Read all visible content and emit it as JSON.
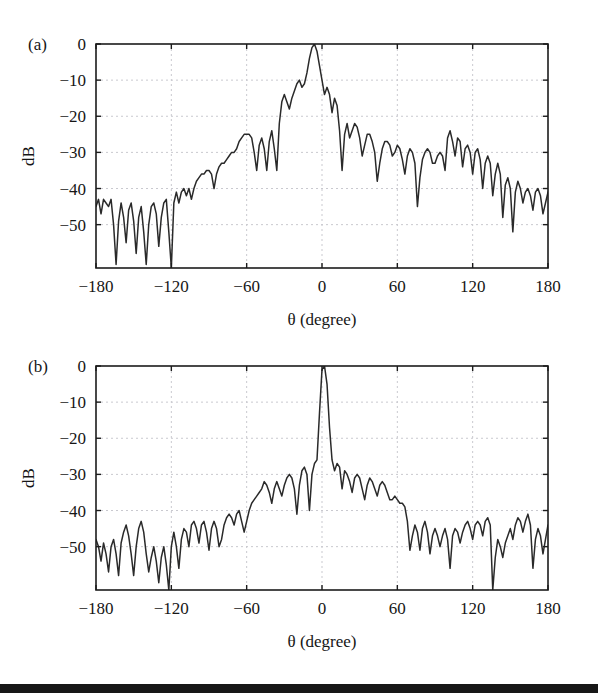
{
  "figure": {
    "background_color": "#ffffff",
    "curve_color": "#2a2a2a",
    "grid_color": "#c9c9cf",
    "axis_color": "#1c1c1c",
    "footer_bar_color": "#171717"
  },
  "panels": [
    {
      "id": "a",
      "label": "(a)",
      "xlabel": "θ (degree)",
      "ylabel": "dB",
      "xticks": [
        -180,
        -120,
        -60,
        0,
        60,
        120,
        180
      ],
      "xtick_labels": [
        "−180",
        "−120",
        "−60",
        "0",
        "60",
        "120",
        "180"
      ],
      "yticks": [
        0,
        -10,
        -20,
        -30,
        -40,
        -50
      ],
      "ytick_labels": [
        "0",
        "−10",
        "−20",
        "−30",
        "−40",
        "−50"
      ],
      "xlim": [
        -180,
        180
      ],
      "ylim": [
        -62,
        0
      ]
    },
    {
      "id": "b",
      "label": "(b)",
      "xlabel": "θ (degree)",
      "ylabel": "dB",
      "xticks": [
        -180,
        -120,
        -60,
        0,
        60,
        120,
        180
      ],
      "xtick_labels": [
        "−180",
        "−120",
        "−60",
        "0",
        "60",
        "120",
        "180"
      ],
      "yticks": [
        0,
        -10,
        -20,
        -30,
        -40,
        -50
      ],
      "ytick_labels": [
        "0",
        "−10",
        "−20",
        "−30",
        "−40",
        "−50"
      ],
      "xlim": [
        -180,
        180
      ],
      "ylim": [
        -62,
        0
      ]
    }
  ],
  "chart_data": [
    {
      "type": "line",
      "title": "(a)",
      "xlabel": "θ (degree)",
      "ylabel": "dB",
      "xlim": [
        -180,
        180
      ],
      "ylim": [
        -62,
        0
      ],
      "grid": true,
      "legend": "none",
      "series": [
        {
          "name": "beam-pattern-a",
          "x": [
            -180,
            -178,
            -176,
            -174,
            -172,
            -170,
            -168,
            -166,
            -164,
            -162,
            -160,
            -158,
            -156,
            -154,
            -152,
            -150,
            -148,
            -146,
            -144,
            -142,
            -140,
            -138,
            -136,
            -134,
            -132,
            -130,
            -128,
            -126,
            -124,
            -122,
            -120,
            -118,
            -116,
            -114,
            -112,
            -110,
            -108,
            -106,
            -104,
            -102,
            -100,
            -98,
            -96,
            -94,
            -92,
            -90,
            -88,
            -86,
            -84,
            -82,
            -80,
            -78,
            -76,
            -74,
            -72,
            -70,
            -68,
            -66,
            -64,
            -62,
            -60,
            -58,
            -56,
            -54,
            -52,
            -50,
            -48,
            -46,
            -44,
            -42,
            -40,
            -38,
            -36,
            -34,
            -32,
            -30,
            -28,
            -26,
            -24,
            -22,
            -20,
            -18,
            -16,
            -14,
            -12,
            -10,
            -8,
            -6,
            -4,
            -2,
            0,
            2,
            4,
            6,
            8,
            10,
            12,
            14,
            16,
            18,
            20,
            22,
            24,
            26,
            28,
            30,
            32,
            34,
            36,
            38,
            40,
            42,
            44,
            46,
            48,
            50,
            52,
            54,
            56,
            58,
            60,
            62,
            64,
            66,
            68,
            70,
            72,
            74,
            76,
            78,
            80,
            82,
            84,
            86,
            88,
            90,
            92,
            94,
            96,
            98,
            100,
            102,
            104,
            106,
            108,
            110,
            112,
            114,
            116,
            118,
            120,
            122,
            124,
            126,
            128,
            130,
            132,
            134,
            136,
            138,
            140,
            142,
            144,
            146,
            148,
            150,
            152,
            154,
            156,
            158,
            160,
            162,
            164,
            166,
            168,
            170,
            172,
            174,
            176,
            178,
            180
          ],
          "y": [
            -45,
            -43,
            -47,
            -43,
            -44,
            -45,
            -43,
            -50,
            -61,
            -49,
            -44,
            -48,
            -55,
            -46,
            -44,
            -49,
            -58,
            -48,
            -45,
            -52,
            -61,
            -50,
            -45,
            -44,
            -47,
            -56,
            -48,
            -44,
            -43,
            -52,
            -62,
            -44,
            -41,
            -44,
            -41,
            -40,
            -42,
            -40,
            -43,
            -40,
            -38,
            -37,
            -36,
            -36,
            -35,
            -35,
            -36,
            -40,
            -36,
            -34,
            -33,
            -33,
            -32,
            -31,
            -30,
            -30,
            -29,
            -27,
            -26,
            -25,
            -25,
            -25,
            -26,
            -30,
            -35,
            -28,
            -26,
            -29,
            -35,
            -27,
            -24,
            -29,
            -35,
            -22,
            -16,
            -14,
            -16,
            -18,
            -15,
            -13,
            -11,
            -10,
            -12,
            -11,
            -8,
            -4,
            -1,
            0,
            -2,
            -6,
            -10,
            -14,
            -12,
            -14,
            -19,
            -15,
            -17,
            -24,
            -35,
            -25,
            -22,
            -26,
            -24,
            -22,
            -23,
            -26,
            -31,
            -28,
            -25,
            -25,
            -27,
            -30,
            -38,
            -33,
            -29,
            -27,
            -27,
            -28,
            -31,
            -30,
            -28,
            -29,
            -32,
            -36,
            -31,
            -29,
            -30,
            -33,
            -45,
            -37,
            -32,
            -30,
            -29,
            -30,
            -33,
            -33,
            -31,
            -30,
            -31,
            -35,
            -26,
            -24,
            -27,
            -31,
            -26,
            -27,
            -34,
            -29,
            -28,
            -30,
            -36,
            -30,
            -29,
            -32,
            -40,
            -33,
            -31,
            -33,
            -42,
            -36,
            -33,
            -36,
            -48,
            -39,
            -37,
            -40,
            -52,
            -41,
            -38,
            -40,
            -44,
            -41,
            -40,
            -42,
            -46,
            -41,
            -40,
            -42,
            -47,
            -44,
            -41,
            -42,
            -45,
            -42,
            -41,
            -43,
            -47,
            -43,
            -41,
            -42,
            -46,
            -43,
            -42,
            -44,
            -48,
            -44,
            -42,
            -43,
            -45,
            -44,
            -43,
            -44,
            -46,
            -44,
            -43,
            -44,
            -45,
            -44,
            -44,
            -45,
            -45,
            -44,
            -44,
            -45,
            -45,
            -45
          ],
          "peak_theta": -42,
          "peak_value": 0
        }
      ]
    },
    {
      "type": "line",
      "title": "(b)",
      "xlabel": "θ (degree)",
      "ylabel": "dB",
      "xlim": [
        -180,
        180
      ],
      "ylim": [
        -62,
        0
      ],
      "grid": true,
      "legend": "none",
      "series": [
        {
          "name": "beam-pattern-b",
          "x": [
            -180,
            -178,
            -176,
            -174,
            -172,
            -170,
            -168,
            -166,
            -164,
            -162,
            -160,
            -158,
            -156,
            -154,
            -152,
            -150,
            -148,
            -146,
            -144,
            -142,
            -140,
            -138,
            -136,
            -134,
            -132,
            -130,
            -128,
            -126,
            -124,
            -122,
            -120,
            -118,
            -116,
            -114,
            -112,
            -110,
            -108,
            -106,
            -104,
            -102,
            -100,
            -98,
            -96,
            -94,
            -92,
            -90,
            -88,
            -86,
            -84,
            -82,
            -80,
            -78,
            -76,
            -74,
            -72,
            -70,
            -68,
            -66,
            -64,
            -62,
            -60,
            -58,
            -56,
            -54,
            -52,
            -50,
            -48,
            -46,
            -44,
            -42,
            -40,
            -38,
            -36,
            -34,
            -32,
            -30,
            -28,
            -26,
            -24,
            -22,
            -20,
            -18,
            -16,
            -14,
            -12,
            -10,
            -8,
            -6,
            -4,
            -2,
            0,
            2,
            4,
            6,
            8,
            10,
            12,
            14,
            16,
            18,
            20,
            22,
            24,
            26,
            28,
            30,
            32,
            34,
            36,
            38,
            40,
            42,
            44,
            46,
            48,
            50,
            52,
            54,
            56,
            58,
            60,
            62,
            64,
            66,
            68,
            70,
            72,
            74,
            76,
            78,
            80,
            82,
            84,
            86,
            88,
            90,
            92,
            94,
            96,
            98,
            100,
            102,
            104,
            106,
            108,
            110,
            112,
            114,
            116,
            118,
            120,
            122,
            124,
            126,
            128,
            130,
            132,
            134,
            136,
            138,
            140,
            142,
            144,
            146,
            148,
            150,
            152,
            154,
            156,
            158,
            160,
            162,
            164,
            166,
            168,
            170,
            172,
            174,
            176,
            178,
            180
          ],
          "y": [
            -48,
            -50,
            -54,
            -49,
            -52,
            -57,
            -50,
            -48,
            -52,
            -58,
            -49,
            -46,
            -44,
            -47,
            -52,
            -58,
            -50,
            -45,
            -43,
            -46,
            -52,
            -57,
            -53,
            -50,
            -54,
            -60,
            -53,
            -50,
            -55,
            -62,
            -50,
            -46,
            -50,
            -56,
            -48,
            -45,
            -46,
            -50,
            -44,
            -43,
            -45,
            -49,
            -44,
            -43,
            -46,
            -51,
            -45,
            -43,
            -45,
            -50,
            -48,
            -44,
            -42,
            -41,
            -42,
            -44,
            -41,
            -40,
            -43,
            -46,
            -43,
            -40,
            -38,
            -37,
            -36,
            -35,
            -34,
            -32,
            -33,
            -35,
            -38,
            -34,
            -32,
            -34,
            -36,
            -33,
            -31,
            -30,
            -31,
            -34,
            -41,
            -33,
            -29,
            -28,
            -30,
            -40,
            -30,
            -27,
            -26,
            -13,
            -1,
            0,
            -5,
            -17,
            -26,
            -29,
            -27,
            -28,
            -34,
            -29,
            -30,
            -32,
            -35,
            -31,
            -30,
            -31,
            -34,
            -37,
            -33,
            -31,
            -32,
            -34,
            -36,
            -33,
            -32,
            -33,
            -35,
            -37,
            -37,
            -36,
            -37,
            -38,
            -38,
            -39,
            -43,
            -51,
            -47,
            -44,
            -46,
            -51,
            -45,
            -43,
            -46,
            -52,
            -47,
            -45,
            -47,
            -50,
            -47,
            -45,
            -48,
            -56,
            -47,
            -45,
            -46,
            -49,
            -46,
            -44,
            -43,
            -45,
            -48,
            -44,
            -43,
            -44,
            -47,
            -43,
            -42,
            -44,
            -62,
            -53,
            -48,
            -50,
            -53,
            -49,
            -47,
            -45,
            -48,
            -44,
            -42,
            -43,
            -46,
            -43,
            -41,
            -44,
            -56,
            -48,
            -45,
            -47,
            -52,
            -48,
            -44,
            -46
          ],
          "peak_theta": 0,
          "peak_value": 0
        }
      ]
    }
  ]
}
